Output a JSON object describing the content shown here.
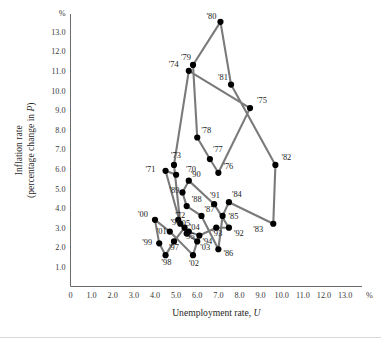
{
  "chart_data": {
    "type": "scatter",
    "title": "",
    "subtitle": "",
    "xlabel": "Unemployment rate, U",
    "xlabel_main": "Unemployment rate,",
    "xlabel_italic": "U",
    "ylabel_line1": "Inflation rate",
    "ylabel_line2": "(percentage change in P)",
    "ylabel_line2_main": "(percentage change in ",
    "ylabel_line2_italic": "P",
    "ylabel_line2_tail": ")",
    "x_unit": "%",
    "y_unit": "%",
    "xlim": [
      0,
      13.8
    ],
    "ylim": [
      0,
      13.9
    ],
    "xticks": [
      "0",
      "1.0",
      "2.0",
      "3.0",
      "4.0",
      "5.0",
      "6.0",
      "7.0",
      "8.0",
      "9.0",
      "10.0",
      "11.0",
      "12.0",
      "13.0"
    ],
    "xtick_values": [
      0,
      1,
      2,
      3,
      4,
      5,
      6,
      7,
      8,
      9,
      10,
      11,
      12,
      13
    ],
    "yticks": [
      "1.0",
      "2.0",
      "3.0",
      "4.0",
      "5.0",
      "6.0",
      "7.0",
      "8.0",
      "9.0",
      "10.0",
      "11.0",
      "12.0",
      "13.0"
    ],
    "ytick_values": [
      1,
      2,
      3,
      4,
      5,
      6,
      7,
      8,
      9,
      10,
      11,
      12,
      13
    ],
    "grid": false,
    "legend": "none",
    "connected": true,
    "series_color": "#7a7a7a",
    "point_color": "#000000",
    "points": [
      {
        "label": "'70",
        "x": 5.0,
        "y": 5.7,
        "lx": 10,
        "ly": -3
      },
      {
        "label": "'71",
        "x": 4.5,
        "y": 5.9,
        "lx": -20,
        "ly": 1
      },
      {
        "label": "'72",
        "x": 5.2,
        "y": 3.2,
        "lx": -5,
        "ly": -6
      },
      {
        "label": "'73",
        "x": 4.9,
        "y": 6.2,
        "lx": -3,
        "ly": -7
      },
      {
        "label": "'74",
        "x": 5.6,
        "y": 11.0,
        "lx": -20,
        "ly": -4
      },
      {
        "label": "'75",
        "x": 8.5,
        "y": 9.1,
        "lx": 7,
        "ly": -5
      },
      {
        "label": "'76",
        "x": 7.0,
        "y": 5.8,
        "lx": 5,
        "ly": -4
      },
      {
        "label": "'77",
        "x": 6.6,
        "y": 6.5,
        "lx": 3,
        "ly": -7
      },
      {
        "label": "'78",
        "x": 6.0,
        "y": 7.6,
        "lx": 4,
        "ly": -5
      },
      {
        "label": "'79",
        "x": 5.8,
        "y": 11.3,
        "lx": -12,
        "ly": -5
      },
      {
        "label": "'80",
        "x": 7.1,
        "y": 13.5,
        "lx": -14,
        "ly": -3
      },
      {
        "label": "'81",
        "x": 7.6,
        "y": 10.3,
        "lx": -13,
        "ly": -5
      },
      {
        "label": "'82",
        "x": 9.7,
        "y": 6.2,
        "lx": 6,
        "ly": -5
      },
      {
        "label": "'83",
        "x": 9.6,
        "y": 3.2,
        "lx": -20,
        "ly": 8
      },
      {
        "label": "'84",
        "x": 7.5,
        "y": 4.3,
        "lx": 3,
        "ly": -5
      },
      {
        "label": "'85",
        "x": 7.2,
        "y": 3.6,
        "lx": 6,
        "ly": 3
      },
      {
        "label": "'86",
        "x": 7.0,
        "y": 1.9,
        "lx": 5,
        "ly": 7
      },
      {
        "label": "'87",
        "x": 6.2,
        "y": 3.6,
        "lx": 3,
        "ly": -4
      },
      {
        "label": "'88",
        "x": 5.5,
        "y": 4.1,
        "lx": 5,
        "ly": -4
      },
      {
        "label": "'89",
        "x": 5.3,
        "y": 4.8,
        "lx": -13,
        "ly": 1
      },
      {
        "label": "'90",
        "x": 5.6,
        "y": 5.4,
        "lx": 2,
        "ly": -4
      },
      {
        "label": "'91",
        "x": 6.8,
        "y": 4.2,
        "lx": -4,
        "ly": -6
      },
      {
        "label": "'92",
        "x": 7.5,
        "y": 3.0,
        "lx": 5,
        "ly": 8
      },
      {
        "label": "'93",
        "x": 6.9,
        "y": 3.0,
        "lx": -4,
        "ly": 8
      },
      {
        "label": "'94",
        "x": 6.1,
        "y": 2.6,
        "lx": 3,
        "ly": 8
      },
      {
        "label": "'95",
        "x": 5.6,
        "y": 2.8,
        "lx": -4,
        "ly": 7
      },
      {
        "label": "'96",
        "x": 5.4,
        "y": 3.0,
        "lx": -14,
        "ly": -3
      },
      {
        "label": "'97",
        "x": 4.9,
        "y": 2.3,
        "lx": -5,
        "ly": 9
      },
      {
        "label": "'98",
        "x": 4.5,
        "y": 1.6,
        "lx": -4,
        "ly": 10
      },
      {
        "label": "'99",
        "x": 4.2,
        "y": 2.2,
        "lx": -17,
        "ly": 2
      },
      {
        "label": "'00",
        "x": 4.0,
        "y": 3.4,
        "lx": -17,
        "ly": -3
      },
      {
        "label": "'01",
        "x": 4.7,
        "y": 2.8,
        "lx": -13,
        "ly": 2
      },
      {
        "label": "'02",
        "x": 5.8,
        "y": 1.6,
        "lx": -4,
        "ly": 11
      },
      {
        "label": "'03",
        "x": 6.0,
        "y": 2.3,
        "lx": 3,
        "ly": 9
      },
      {
        "label": "'04",
        "x": 5.5,
        "y": 2.7,
        "lx": 3,
        "ly": -4
      },
      {
        "label": "'05",
        "x": 5.1,
        "y": 3.4,
        "lx": 2,
        "ly": 6
      }
    ],
    "series_order": [
      "'70",
      "'71",
      "'72",
      "'73",
      "'74",
      "'75",
      "'76",
      "'77",
      "'78",
      "'79",
      "'80",
      "'81",
      "'82",
      "'83",
      "'84",
      "'85",
      "'86",
      "'87",
      "'88",
      "'89",
      "'90",
      "'91",
      "'92",
      "'93",
      "'94",
      "'95",
      "'96",
      "'97",
      "'98",
      "'99",
      "'00",
      "'01",
      "'02",
      "'03",
      "'04",
      "'05"
    ]
  }
}
